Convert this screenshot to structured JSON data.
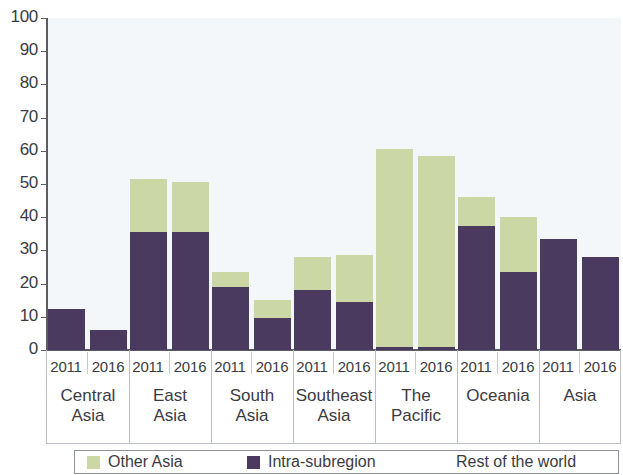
{
  "chart_data": {
    "type": "bar",
    "subtype": "stacked-bar-grouped",
    "title": "",
    "xlabel": "",
    "ylabel": "",
    "ylim": [
      0,
      100
    ],
    "ytick_labels": [
      "100",
      "90",
      "80",
      "70",
      "60",
      "50",
      "40",
      "30",
      "20",
      "10",
      "0"
    ],
    "ytick_values": [
      100,
      90,
      80,
      70,
      60,
      50,
      40,
      30,
      20,
      10,
      0
    ],
    "grid": false,
    "legend_position": "bottom",
    "categories": [
      "Central Asia",
      "East Asia",
      "South Asia",
      "Southeast Asia",
      "The Pacific",
      "Oceania",
      "Asia"
    ],
    "sub_categories": [
      "2011",
      "2016"
    ],
    "series": [
      {
        "name": "Intra-subregion",
        "color": "#4a3a60",
        "values_2011": [
          12.5,
          35.5,
          19.0,
          18.0,
          1.0,
          37.5,
          33.5
        ],
        "values_2016": [
          6.0,
          35.5,
          9.5,
          14.5,
          1.0,
          23.5,
          28.0
        ]
      },
      {
        "name": "Other Asia",
        "color": "#ccd7a6",
        "values_2011": [
          0.0,
          16.0,
          4.5,
          10.0,
          59.5,
          8.5,
          0.0
        ],
        "values_2016": [
          0.0,
          15.0,
          5.5,
          14.0,
          57.5,
          16.5,
          0.0
        ]
      }
    ],
    "totals_2011": [
      12.5,
      51.5,
      23.5,
      28.0,
      60.5,
      46.0,
      33.5
    ],
    "totals_2016": [
      6.0,
      50.5,
      15.0,
      28.5,
      58.5,
      40.0,
      28.0
    ]
  },
  "axis": {
    "y_ticks": [
      {
        "label": "100",
        "value": 100
      },
      {
        "label": "90",
        "value": 90
      },
      {
        "label": "80",
        "value": 80
      },
      {
        "label": "70",
        "value": 70
      },
      {
        "label": "60",
        "value": 60
      },
      {
        "label": "50",
        "value": 50
      },
      {
        "label": "40",
        "value": 40
      },
      {
        "label": "30",
        "value": 30
      },
      {
        "label": "20",
        "value": 20
      },
      {
        "label": "10",
        "value": 10
      },
      {
        "label": "0",
        "value": 0
      }
    ]
  },
  "groups": [
    {
      "label_line1": "Central",
      "label_line2": "Asia",
      "bars": [
        {
          "year": "2011",
          "dark": 12.5,
          "green": 0.0
        },
        {
          "year": "2016",
          "dark": 6.0,
          "green": 0.0
        }
      ]
    },
    {
      "label_line1": "East",
      "label_line2": "Asia",
      "bars": [
        {
          "year": "2011",
          "dark": 35.5,
          "green": 16.0
        },
        {
          "year": "2016",
          "dark": 35.5,
          "green": 15.0
        }
      ]
    },
    {
      "label_line1": "South",
      "label_line2": "Asia",
      "bars": [
        {
          "year": "2011",
          "dark": 19.0,
          "green": 4.5
        },
        {
          "year": "2016",
          "dark": 9.5,
          "green": 5.5
        }
      ]
    },
    {
      "label_line1": "Southeast",
      "label_line2": "Asia",
      "bars": [
        {
          "year": "2011",
          "dark": 18.0,
          "green": 10.0
        },
        {
          "year": "2016",
          "dark": 14.5,
          "green": 14.0
        }
      ]
    },
    {
      "label_line1": "The",
      "label_line2": "Pacific",
      "bars": [
        {
          "year": "2011",
          "dark": 1.0,
          "green": 59.5
        },
        {
          "year": "2016",
          "dark": 1.0,
          "green": 57.5
        }
      ]
    },
    {
      "label_line1": "Oceania",
      "label_line2": "",
      "bars": [
        {
          "year": "2011",
          "dark": 37.5,
          "green": 8.5
        },
        {
          "year": "2016",
          "dark": 23.5,
          "green": 16.5
        }
      ]
    },
    {
      "label_line1": "Asia",
      "label_line2": "",
      "bars": [
        {
          "year": "2011",
          "dark": 33.5,
          "green": 0.0
        },
        {
          "year": "2016",
          "dark": 28.0,
          "green": 0.0
        }
      ]
    }
  ],
  "legend": {
    "items": [
      {
        "label": "Other Asia",
        "color": "#ccd7a6",
        "swatch": true
      },
      {
        "label": "Intra-subregion",
        "color": "#4a3a60",
        "swatch": true
      },
      {
        "label": "Rest of the world",
        "color": "#f3f7f9",
        "swatch": false
      }
    ]
  },
  "colors": {
    "dark_purple": "#4a3a60",
    "light_green": "#ccd7a6",
    "plot_background": "#f3f7f9",
    "axis": "#5c5c64",
    "text": "#3b3b42"
  }
}
